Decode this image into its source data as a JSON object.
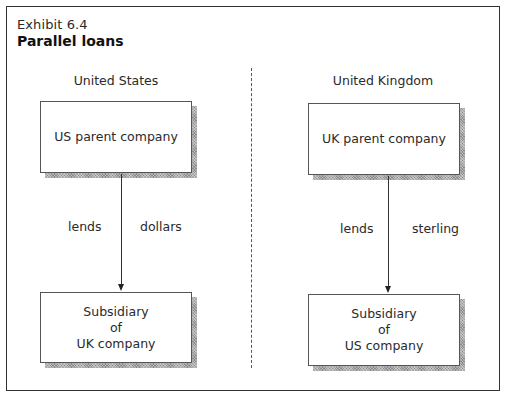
{
  "exhibit": {
    "label": "Exhibit 6.4",
    "title": "Parallel loans"
  },
  "regions": {
    "left": "United States",
    "right": "United Kingdom"
  },
  "boxes": {
    "us_parent": "US parent company",
    "uk_parent": "UK parent company",
    "sub_uk": {
      "line1": "Subsidiary",
      "line2": "of",
      "line3": "UK company"
    },
    "sub_us": {
      "line1": "Subsidiary",
      "line2": "of",
      "line3": "US company"
    }
  },
  "flows": {
    "left": {
      "verb": "lends",
      "currency": "dollars",
      "from": "US parent company",
      "to": "Subsidiary of UK company"
    },
    "right": {
      "verb": "lends",
      "currency": "sterling",
      "from": "UK parent company",
      "to": "Subsidiary of US company"
    }
  }
}
